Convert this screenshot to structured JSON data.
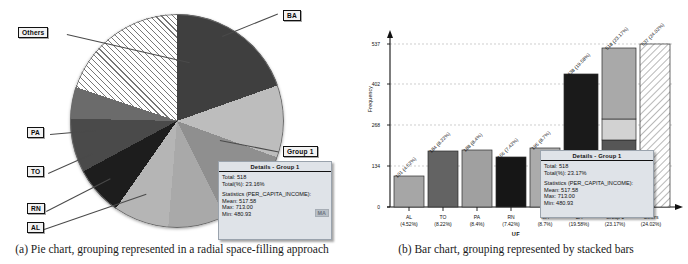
{
  "figure": {
    "panel_a": {
      "caption": "(a)  Pie chart, grouping represented in a radial space-filling approach",
      "callouts": [
        {
          "label": "BA"
        },
        {
          "label": "Others"
        },
        {
          "label": "PA"
        },
        {
          "label": "TO"
        },
        {
          "label": "RN"
        },
        {
          "label": "AL"
        },
        {
          "label": "Group 1"
        }
      ],
      "tooltip": {
        "title": "Details - Group 1",
        "total_line": "Total: 518",
        "total_pct_line": "Total(%): 23.16%",
        "statistics_header": "Statistics (PER_CAPITA_INCOME):",
        "mean_line": "Mean: 517.58",
        "max_line": "Max: 713.00",
        "min_line": "Min: 480.93",
        "badge": "MA"
      }
    },
    "panel_b": {
      "caption": "(b)  Bar chart, grouping represented by stacked bars",
      "tooltip": {
        "title": "Details - Group 1",
        "total_line": "Total: 518",
        "total_pct_line": "Total(%): 23.17%",
        "statistics_header": "Statistics (PER_CAPITA_INCOME):",
        "mean_line": "Mean: 517.58",
        "max_line": "Max: 713.00",
        "min_line": "Min: 480.93",
        "badge": "MA"
      }
    }
  },
  "chart_data": [
    {
      "type": "pie",
      "title": "",
      "labels": [
        "BA",
        "Group 1",
        "MA",
        "AL",
        "RN",
        "TO",
        "PA",
        "Others"
      ],
      "values": [
        19.58,
        23.17,
        8.7,
        7.42,
        8.4,
        8.22,
        4.52,
        24.02
      ],
      "unit": "%",
      "legend": "callout-labels",
      "colors": [
        "#3a3a3a",
        "#bdbdbd",
        "#a8a8a8",
        "#1f1f1f",
        "#4f4f4f",
        "#6e6e6e",
        "#8a8a8a",
        "hatched"
      ],
      "group_1_is_aggregate": true
    },
    {
      "type": "bar",
      "title": "",
      "xlabel": "UF",
      "ylabel": "Frequency",
      "categories": [
        "AL",
        "TO",
        "PA",
        "RN",
        "MA",
        "BA",
        "Group 1",
        "Others"
      ],
      "category_pcts": [
        "(4.52%)",
        "(8.22%)",
        "(8.4%)",
        "(7.42%)",
        "(8.7%)",
        "(19.58%)",
        "(23.17%)",
        "(24.02%)"
      ],
      "values": [
        101,
        184,
        188,
        166,
        195,
        438,
        518,
        537
      ],
      "bar_labels": [
        "101 (4.52%)",
        "184 (8.22%)",
        "188 (8.4%)",
        "166 (7.42%)",
        "195 (8.7%)",
        "438 (19.58%)",
        "518 (23.17%)",
        "537 (24.02%)"
      ],
      "yticks": [
        0,
        134,
        268,
        402,
        537
      ],
      "ylim": [
        0,
        537
      ],
      "grid": true,
      "stacked_last_two": true,
      "stack_group1_segments": [
        {
          "name": "segment-dark",
          "value": 166
        },
        {
          "name": "segment-mid",
          "value": 55
        },
        {
          "name": "segment-light-lower",
          "value": 70
        },
        {
          "name": "segment-light-upper",
          "value": 227
        }
      ]
    }
  ]
}
